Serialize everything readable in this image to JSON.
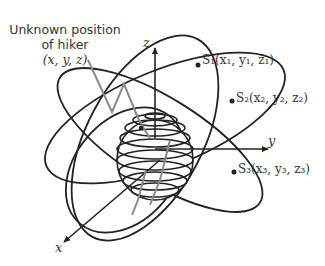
{
  "figure": {
    "type": "GPS trilateration diagram",
    "hiker": {
      "line1": "Unknown position",
      "line2": "of hiker",
      "coords": "(x, y, z)"
    },
    "axes": {
      "x": "x",
      "y": "y",
      "z": "z"
    },
    "satellites": [
      {
        "name": "S1",
        "label": "S₁(x₁, y₁, z₁)"
      },
      {
        "name": "S2",
        "label": "S₂(x₂, y₂, z₂)"
      },
      {
        "name": "S3",
        "label": "S₃(x₃, y₃, z₃)"
      }
    ],
    "colors": {
      "orbit": "#222222",
      "signal": "#8a8a8a",
      "text": "#333333"
    }
  }
}
